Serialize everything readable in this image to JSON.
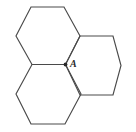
{
  "figure": {
    "background_color": "#ffffff",
    "stroke_color": "#4a4a4a",
    "stroke_width": 1.15,
    "label_color": "#2b2b2b",
    "width": 136,
    "height": 132,
    "labels": [
      {
        "id": "A",
        "text": "A",
        "x": 70,
        "y": 67
      }
    ],
    "vertices": [
      {
        "id": "A",
        "x": 65.5,
        "y": 64.5,
        "marked": true,
        "radius": 1.9
      }
    ],
    "shapes": [
      {
        "id": "hexagon-top-left",
        "name": "top-left-hexagon",
        "points": "31,7 64,7 80,36 65.5,64.5 32,64.5 16,36"
      },
      {
        "id": "hexagon-bottom-left",
        "name": "bottom-left-hexagon",
        "points": "32,64.5 65.5,64.5 81,94 65,124 31,124 16,94"
      },
      {
        "id": "hexagon-right",
        "name": "right-hexagon",
        "points": "65.5,64.5 80,36 113,36 121,65.5 113,95 80,95"
      }
    ]
  }
}
